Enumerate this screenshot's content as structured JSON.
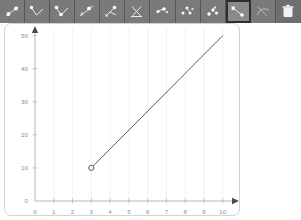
{
  "toolbar": {
    "buttons": [
      {
        "name": "point-on-line-tool",
        "label": "Point on line",
        "icon": "line-with-point-icon",
        "selected": false
      },
      {
        "name": "two-segment-tool",
        "label": "Two segments",
        "icon": "v-shape-icon",
        "selected": false
      },
      {
        "name": "two-segment-points-tool",
        "label": "Two segments points",
        "icon": "v-shape-points-icon",
        "selected": false
      },
      {
        "name": "segment-ray-tool",
        "label": "Segment and ray",
        "icon": "segment-ray-icon",
        "selected": false
      },
      {
        "name": "branching-tool",
        "label": "Branching lines",
        "icon": "branch-icon",
        "selected": false
      },
      {
        "name": "crossing-lines-tool",
        "label": "Crossing lines",
        "icon": "x-cross-icon",
        "selected": false
      },
      {
        "name": "scatter-small-tool",
        "label": "Scatter small",
        "icon": "scatter-small-icon",
        "selected": false
      },
      {
        "name": "scatter-spread-tool",
        "label": "Scatter spread",
        "icon": "scatter-spread-icon",
        "selected": false
      },
      {
        "name": "scatter-cluster-tool",
        "label": "Scatter cluster",
        "icon": "scatter-cluster-icon",
        "selected": false
      },
      {
        "name": "ray-open-point-tool",
        "label": "Ray with open point",
        "icon": "ray-open-point-icon",
        "selected": true
      },
      {
        "name": "curve-tool",
        "label": "Curve",
        "icon": "curve-icon",
        "selected": false
      },
      {
        "name": "delete-tool",
        "label": "Delete",
        "icon": "trash-icon",
        "selected": false
      }
    ]
  },
  "chart_data": {
    "type": "line",
    "title": "",
    "xlabel": "",
    "ylabel": "",
    "xlim": [
      0,
      10.6
    ],
    "ylim": [
      0,
      52
    ],
    "grid": true,
    "grid_axis": "x",
    "legend": "none",
    "x_ticks": [
      0,
      1,
      2,
      3,
      4,
      5,
      6,
      7,
      8,
      9,
      10
    ],
    "x_tick_labels": [
      "0",
      "1",
      "2",
      "3",
      "4",
      "5",
      "6",
      "7",
      "8",
      "9",
      "10"
    ],
    "y_ticks": [
      0,
      10,
      20,
      30,
      40,
      50
    ],
    "y_tick_labels": [
      "0",
      "10",
      "20",
      "30",
      "40",
      "50"
    ],
    "series": [
      {
        "name": "ray",
        "x": [
          3,
          10
        ],
        "y": [
          10,
          50
        ],
        "marker_start": "open-circle",
        "marker_end": "none",
        "color": "#4a4a4a"
      }
    ],
    "points": [
      {
        "x": 3,
        "y": 10,
        "style": "open-circle"
      }
    ]
  },
  "colors": {
    "toolbar_background": "#6e6e6e",
    "toolbar_button": "#7a7a7a",
    "toolbar_selected_border": "#2e2e2e",
    "plot_background": "#ffffff",
    "grid": "#e8e8ef",
    "axis": "#9a9a9a",
    "tick_text": "#8d8d8d",
    "data_line": "#4a4a4a"
  }
}
